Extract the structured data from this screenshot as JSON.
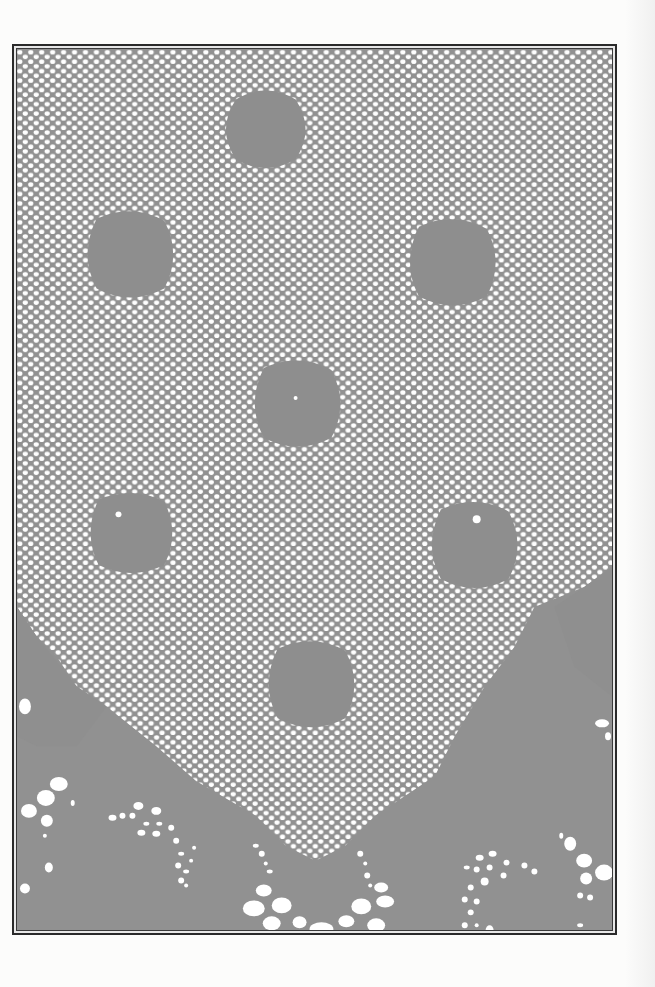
{
  "image": {
    "subject": "crocheted filet lace panel",
    "description": "Gray field densely covered by a white mesh of small dots, with solid darker motif patches and an open-work border with flourishes at the bottom, enclosed by a double-line frame",
    "colors": {
      "background_page": "#fcfcfb",
      "field_gray": "#919191",
      "mesh_dot": "#ffffff",
      "frame_line": "#2a2a2a"
    },
    "frame": {
      "left": 12,
      "top": 44,
      "right": 617,
      "bottom": 935
    },
    "solid_motifs": [
      {
        "name": "top-center",
        "cx": 262,
        "cy": 100,
        "r": 30
      },
      {
        "name": "upper-left",
        "cx": 118,
        "cy": 240,
        "r": 32
      },
      {
        "name": "upper-right",
        "cx": 440,
        "cy": 245,
        "r": 32
      },
      {
        "name": "center",
        "cx": 285,
        "cy": 390,
        "r": 32
      },
      {
        "name": "middle-left",
        "cx": 120,
        "cy": 520,
        "r": 30
      },
      {
        "name": "middle-right",
        "cx": 465,
        "cy": 530,
        "r": 32
      },
      {
        "name": "lower-center",
        "cx": 300,
        "cy": 670,
        "r": 32
      }
    ]
  }
}
